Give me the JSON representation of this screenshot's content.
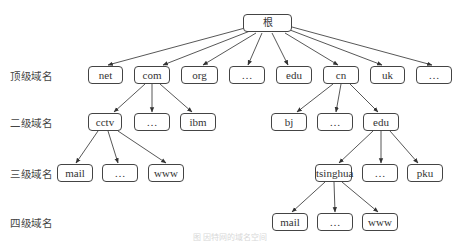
{
  "diagram": {
    "type": "tree",
    "level_labels": [
      "顶级域名",
      "二级域名",
      "三级域名",
      "四级域名"
    ],
    "root": {
      "label": "根"
    },
    "top_level": [
      "net",
      "com",
      "org",
      "…",
      "edu",
      "cn",
      "uk",
      "…"
    ],
    "com_children": [
      "cctv",
      "…",
      "ibm"
    ],
    "cctv_children": [
      "mail",
      "…",
      "www"
    ],
    "cn_children": [
      "bj",
      "…",
      "edu"
    ],
    "cn_edu_children": [
      "tsinghua",
      "…",
      "pku"
    ],
    "tsinghua_children": [
      "mail",
      "…",
      "www"
    ],
    "caption": "图 因特网的域名空间"
  }
}
